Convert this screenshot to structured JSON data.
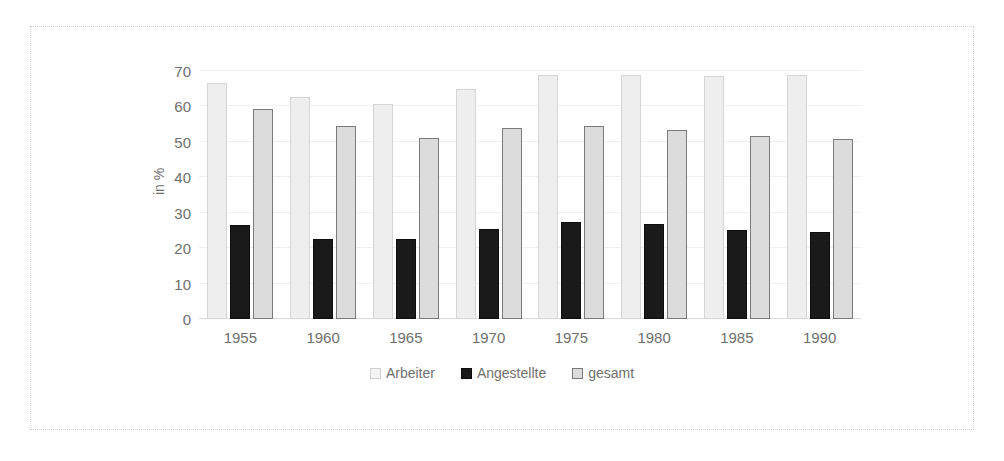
{
  "chart_data": {
    "type": "bar",
    "title": "",
    "xlabel": "",
    "ylabel": "in %",
    "categories": [
      "1955",
      "1960",
      "1965",
      "1970",
      "1975",
      "1980",
      "1985",
      "1990"
    ],
    "series": [
      {
        "name": "Arbeiter",
        "color": "#eeeeee",
        "values": [
          66.7,
          62.7,
          60.8,
          65.0,
          69.0,
          68.8,
          68.6,
          69.0
        ]
      },
      {
        "name": "Angestellte",
        "color": "#1a1a1a",
        "values": [
          26.6,
          22.6,
          22.6,
          25.5,
          27.5,
          26.9,
          25.1,
          24.6
        ]
      },
      {
        "name": "gesamt",
        "color": "#dcdcdc",
        "values": [
          59.3,
          54.4,
          51.2,
          53.8,
          54.4,
          53.4,
          51.6,
          50.9
        ]
      }
    ],
    "ylim": [
      0,
      70
    ],
    "yticks": [
      0,
      10,
      20,
      30,
      40,
      50,
      60,
      70
    ],
    "ytick_labels": [
      "0",
      "10",
      "20",
      "30",
      "40",
      "50",
      "60",
      "70"
    ],
    "grid": true,
    "legend_position": "bottom"
  }
}
